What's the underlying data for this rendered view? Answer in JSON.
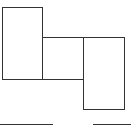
{
  "diagram": {
    "type": "block-diagram",
    "stroke_color": "#333333",
    "background_color": "#ffffff",
    "boxes": [
      {
        "id": "left-tall-box",
        "x": 2,
        "y": 7,
        "w": 41,
        "h": 73
      },
      {
        "id": "middle-square-box",
        "x": 42,
        "y": 37,
        "w": 42,
        "h": 43
      },
      {
        "id": "right-tall-box",
        "x": 83,
        "y": 37,
        "w": 42,
        "h": 73
      }
    ],
    "lines": [
      {
        "id": "bottom-left-line",
        "x": 0,
        "y": 124,
        "w": 53
      },
      {
        "id": "bottom-right-line",
        "x": 93,
        "y": 124,
        "w": 38
      }
    ]
  }
}
